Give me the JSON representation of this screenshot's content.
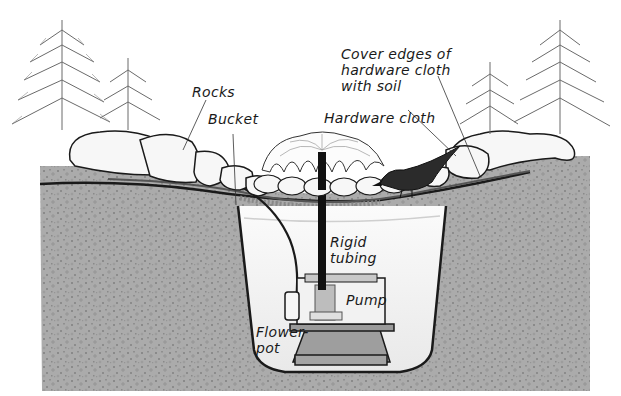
{
  "diagram": {
    "labels": {
      "rocks": "Rocks",
      "bucket": "Bucket",
      "cover_edges": "Cover edges of\nhardware cloth\nwith soil",
      "hardware_cloth": "Hardware cloth",
      "rigid_tubing": "Rigid\ntubing",
      "pump": "Pump",
      "flower_pot": "Flower-\npot"
    },
    "colors": {
      "background": "#ffffff",
      "soil": "#a8a8a8",
      "soil_speckle": "#8c8c8c",
      "water": "#f0f0f0",
      "outline": "#1a1a1a",
      "rock": "#f7f7f7",
      "pump": "#e8e8e8",
      "pot": "#9a9a9a",
      "tubing": "#111111",
      "foliage": "#6e6e6e",
      "bird": "#2a2a2a"
    }
  }
}
